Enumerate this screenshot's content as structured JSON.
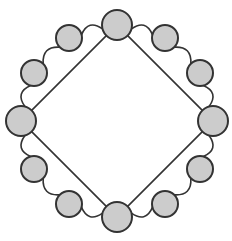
{
  "figure": {
    "name": "ring-with-inscribed-diamond-graph",
    "type": "node-link-diagram",
    "background_color": "#ffffff",
    "width": 232,
    "height": 241,
    "node_count": 12,
    "edge_count": 16
  },
  "style": {
    "node_fill": "#cccccc",
    "node_stroke": "#333333",
    "node_stroke_width": 2,
    "edge_stroke": "#333333",
    "arc_stroke_width": 1.6,
    "chord_stroke_width": 1.6,
    "corner_node_radius": 15,
    "ring_node_radius": 13,
    "layout_center_x": 117,
    "layout_center_y": 121,
    "layout_radius": 96,
    "arc_bulge": 0.14
  },
  "nodes": [
    {
      "id": "n0",
      "label": "",
      "role": "corner",
      "angle_deg": -90,
      "cx": 117,
      "cy": 25,
      "r": 15,
      "degree": 4
    },
    {
      "id": "n1",
      "label": "",
      "role": "intermediate",
      "angle_deg": -60,
      "cx": 165,
      "cy": 38,
      "r": 13,
      "degree": 2
    },
    {
      "id": "n2",
      "label": "",
      "role": "intermediate",
      "angle_deg": -30,
      "cx": 200,
      "cy": 73,
      "r": 13,
      "degree": 2
    },
    {
      "id": "n3",
      "label": "",
      "role": "corner",
      "angle_deg": 0,
      "cx": 213,
      "cy": 121,
      "r": 15,
      "degree": 4
    },
    {
      "id": "n4",
      "label": "",
      "role": "intermediate",
      "angle_deg": 30,
      "cx": 200,
      "cy": 169,
      "r": 13,
      "degree": 2
    },
    {
      "id": "n5",
      "label": "",
      "role": "intermediate",
      "angle_deg": 60,
      "cx": 165,
      "cy": 204,
      "r": 13,
      "degree": 2
    },
    {
      "id": "n6",
      "label": "",
      "role": "corner",
      "angle_deg": 90,
      "cx": 117,
      "cy": 217,
      "r": 15,
      "degree": 4
    },
    {
      "id": "n7",
      "label": "",
      "role": "intermediate",
      "angle_deg": 120,
      "cx": 69,
      "cy": 204,
      "r": 13,
      "degree": 2
    },
    {
      "id": "n8",
      "label": "",
      "role": "intermediate",
      "angle_deg": 150,
      "cx": 34,
      "cy": 169,
      "r": 13,
      "degree": 2
    },
    {
      "id": "n9",
      "label": "",
      "role": "corner",
      "angle_deg": 180,
      "cx": 21,
      "cy": 121,
      "r": 15,
      "degree": 4
    },
    {
      "id": "n10",
      "label": "",
      "role": "intermediate",
      "angle_deg": 210,
      "cx": 34,
      "cy": 73,
      "r": 13,
      "degree": 2
    },
    {
      "id": "n11",
      "label": "",
      "role": "intermediate",
      "angle_deg": 240,
      "cx": 69,
      "cy": 38,
      "r": 13,
      "degree": 2
    }
  ],
  "edges": {
    "ring_arcs": [
      {
        "from": "n0",
        "to": "n1"
      },
      {
        "from": "n1",
        "to": "n2"
      },
      {
        "from": "n2",
        "to": "n3"
      },
      {
        "from": "n3",
        "to": "n4"
      },
      {
        "from": "n4",
        "to": "n5"
      },
      {
        "from": "n5",
        "to": "n6"
      },
      {
        "from": "n6",
        "to": "n7"
      },
      {
        "from": "n7",
        "to": "n8"
      },
      {
        "from": "n8",
        "to": "n9"
      },
      {
        "from": "n9",
        "to": "n10"
      },
      {
        "from": "n10",
        "to": "n11"
      },
      {
        "from": "n11",
        "to": "n0"
      }
    ],
    "chords": [
      {
        "from": "n0",
        "to": "n3"
      },
      {
        "from": "n3",
        "to": "n6"
      },
      {
        "from": "n6",
        "to": "n9"
      },
      {
        "from": "n9",
        "to": "n0"
      }
    ]
  }
}
